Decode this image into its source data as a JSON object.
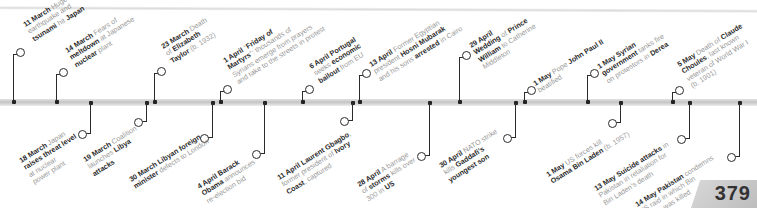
{
  "page": {
    "number": "379"
  },
  "timeline": {
    "above": [
      {
        "x": 13,
        "ring_y": 48,
        "label_x": 22,
        "label_y": 22,
        "parts": [
          [
            "11 March",
            true
          ],
          [
            " Huge",
            false
          ],
          [
            "|earthquake and",
            false
          ],
          [
            "|tsunami",
            true
          ],
          [
            " hit ",
            false
          ],
          [
            "Japan",
            true
          ]
        ]
      },
      {
        "x": 56,
        "ring_y": 68,
        "label_x": 64,
        "label_y": 48,
        "parts": [
          [
            "14 March",
            true
          ],
          [
            " Fears of",
            false
          ],
          [
            "|meltdown",
            true
          ],
          [
            " at Japanese",
            false
          ],
          [
            "|nuclear",
            true
          ],
          [
            " plant",
            false
          ]
        ]
      },
      {
        "x": 154,
        "ring_y": 67,
        "label_x": 160,
        "label_y": 44,
        "parts": [
          [
            "23 March",
            true
          ],
          [
            " Death",
            false
          ],
          [
            "|of ",
            false
          ],
          [
            "Elizabeth",
            true
          ],
          [
            "|Taylor",
            true
          ],
          [
            " (b. 1932)",
            false
          ]
        ]
      },
      {
        "x": 220,
        "ring_y": 85,
        "label_x": 222,
        "label_y": 58,
        "parts": [
          [
            "1 April",
            true
          ],
          [
            " “",
            false
          ],
          [
            "Friday of",
            true
          ],
          [
            "|Martyrs",
            true
          ],
          [
            "”: thousands of",
            false
          ],
          [
            "|Syrians emerge from prayers",
            false
          ],
          [
            "|and take to the streets in protest",
            false
          ]
        ]
      },
      {
        "x": 302,
        "ring_y": 85,
        "label_x": 308,
        "label_y": 64,
        "parts": [
          [
            "6 April Portugal",
            true
          ],
          [
            "|seeks ",
            false
          ],
          [
            "economic",
            true
          ],
          [
            "|bailout",
            true
          ],
          [
            " from EU",
            false
          ]
        ]
      },
      {
        "x": 359,
        "ring_y": 69,
        "label_x": 368,
        "label_y": 62,
        "parts": [
          [
            "13 April",
            true
          ],
          [
            " Former Egyptian",
            false
          ],
          [
            "|president ",
            false
          ],
          [
            "Hosni Mubarak",
            true
          ],
          [
            "|and his sons ",
            false
          ],
          [
            "arrested",
            true
          ],
          [
            " in Cairo",
            false
          ]
        ]
      },
      {
        "x": 459,
        "ring_y": 51,
        "label_x": 468,
        "label_y": 43,
        "parts": [
          [
            "29 April",
            true
          ],
          [
            "|Wedding",
            true
          ],
          [
            " of ",
            false
          ],
          [
            "Prince",
            true
          ],
          [
            "|William",
            true
          ],
          [
            " to Catherine",
            false
          ],
          [
            "|Middleton",
            false
          ]
        ]
      },
      {
        "x": 524,
        "ring_y": 86,
        "label_x": 532,
        "label_y": 81,
        "parts": [
          [
            "1 May",
            true
          ],
          [
            " Pope ",
            false
          ],
          [
            "John Paul II",
            true
          ],
          [
            "|beatified",
            false
          ]
        ]
      },
      {
        "x": 587,
        "ring_y": 69,
        "label_x": 596,
        "label_y": 64,
        "parts": [
          [
            "1 May Syrian",
            true
          ],
          [
            "|government",
            true
          ],
          [
            " tanks fire",
            false
          ],
          [
            "|on protestors in ",
            false
          ],
          [
            "Derea",
            true
          ]
        ]
      },
      {
        "x": 672,
        "ring_y": 86,
        "label_x": 676,
        "label_y": 62,
        "parts": [
          [
            "5 May",
            true
          ],
          [
            " Death of ",
            false
          ],
          [
            "Claude",
            true
          ],
          [
            "|Choules",
            true
          ],
          [
            ", last known",
            false
          ],
          [
            "|veteran of World War I",
            false
          ],
          [
            "|(b. 1901)",
            false
          ]
        ]
      }
    ],
    "below": [
      {
        "x": 90,
        "ring_y": 133,
        "label_x": 18,
        "label_y": 158,
        "parts": [
          [
            "18 March",
            true
          ],
          [
            " Japan",
            false
          ],
          [
            "|raises threat level",
            true
          ],
          [
            "|at nuclear",
            false
          ],
          [
            "|power plant",
            false
          ]
        ]
      },
      {
        "x": 146,
        "ring_y": 121,
        "label_x": 82,
        "label_y": 157,
        "parts": [
          [
            "19 March",
            true
          ],
          [
            " Coalition",
            false
          ],
          [
            "|launches ",
            false
          ],
          [
            "Libya",
            true
          ],
          [
            "|attacks",
            true
          ]
        ]
      },
      {
        "x": 212,
        "ring_y": 137,
        "label_x": 128,
        "label_y": 177,
        "parts": [
          [
            "30 March Libyan foreign",
            true
          ],
          [
            "|minister",
            true
          ],
          [
            " defects to London",
            false
          ]
        ]
      },
      {
        "x": 264,
        "ring_y": 153,
        "label_x": 196,
        "label_y": 184,
        "parts": [
          [
            "4 April Barack",
            true
          ],
          [
            "|Obama",
            true
          ],
          [
            " announces",
            false
          ],
          [
            "|re-election bid",
            false
          ]
        ]
      },
      {
        "x": 352,
        "ring_y": 120,
        "label_x": 276,
        "label_y": 175,
        "parts": [
          [
            "11 April Laurent Gbagbo",
            true
          ],
          [
            ",",
            false
          ],
          [
            "|former president of ",
            false
          ],
          [
            "Ivory",
            true
          ],
          [
            "|Coast",
            true
          ],
          [
            ", captured",
            false
          ]
        ]
      },
      {
        "x": 429,
        "ring_y": 155,
        "label_x": 356,
        "label_y": 182,
        "parts": [
          [
            "28 April",
            true
          ],
          [
            " A barrage",
            false
          ],
          [
            "|of ",
            false
          ],
          [
            "storms",
            true
          ],
          [
            " kills over",
            false
          ],
          [
            "|300 in ",
            false
          ],
          [
            "US",
            true
          ]
        ]
      },
      {
        "x": 515,
        "ring_y": 137,
        "label_x": 438,
        "label_y": 163,
        "parts": [
          [
            "30 April",
            true
          ],
          [
            " NATO strike",
            false
          ],
          [
            "|kills ",
            false
          ],
          [
            "Gaddafi’s",
            true
          ],
          [
            "|youngest son",
            true
          ]
        ]
      },
      {
        "x": 620,
        "ring_y": 122,
        "label_x": 545,
        "label_y": 172,
        "parts": [
          [
            "1 May",
            true
          ],
          [
            " US forces kill",
            false
          ],
          [
            "|Osama Bin Laden",
            true
          ],
          [
            " (b. 1957)",
            false
          ]
        ]
      },
      {
        "x": 689,
        "ring_y": 138,
        "label_x": 593,
        "label_y": 186,
        "parts": [
          [
            "13 May Suicide attacks",
            true
          ],
          [
            " in",
            false
          ],
          [
            "|Pakistan in retaliation for",
            false
          ],
          [
            "|Bin Laden’s death",
            false
          ]
        ]
      },
      {
        "x": 739,
        "ring_y": 156,
        "label_x": 634,
        "label_y": 202,
        "parts": [
          [
            "14 May Pakistan",
            true
          ],
          [
            " condemns",
            false
          ],
          [
            "|US raid in which Bin",
            false
          ],
          [
            "|Laden was killed",
            false
          ]
        ]
      }
    ]
  }
}
